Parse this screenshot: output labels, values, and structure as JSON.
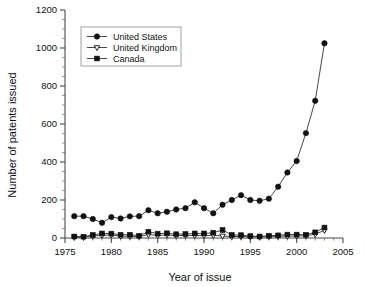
{
  "chart_data": {
    "type": "line",
    "title": "",
    "xlabel": "Year of issue",
    "ylabel": "Number of patents issued",
    "xlim": [
      1975,
      2005
    ],
    "ylim": [
      0,
      1200
    ],
    "xticks": [
      1975,
      1980,
      1985,
      1990,
      1995,
      2000,
      2005
    ],
    "xtick_labels": [
      "1975",
      "1980",
      "1985",
      "1990",
      "1995",
      "2000",
      "2005"
    ],
    "yticks": [
      0,
      200,
      400,
      600,
      800,
      1000,
      1200
    ],
    "ytick_labels": [
      "0",
      "200",
      "400",
      "600",
      "800",
      "1000",
      "1200"
    ],
    "x_minor_step": 1,
    "y_minor_step": 50,
    "grid": false,
    "legend_position": "upper left",
    "x": [
      1976,
      1977,
      1978,
      1979,
      1980,
      1981,
      1982,
      1983,
      1984,
      1985,
      1986,
      1987,
      1988,
      1989,
      1990,
      1991,
      1992,
      1993,
      1994,
      1995,
      1996,
      1997,
      1998,
      1999,
      2000,
      2001,
      2002,
      2003
    ],
    "series": [
      {
        "name": "United States",
        "marker": "filled-circle",
        "values": [
          115,
          115,
          100,
          80,
          110,
          103,
          114,
          115,
          146,
          130,
          138,
          150,
          157,
          188,
          157,
          130,
          175,
          200,
          225,
          200,
          196,
          207,
          270,
          345,
          405,
          552,
          722,
          1025
        ]
      },
      {
        "name": "United Kingdom",
        "marker": "open-triangle-down",
        "values": [
          4,
          4,
          10,
          14,
          16,
          10,
          9,
          8,
          18,
          13,
          16,
          12,
          14,
          13,
          13,
          14,
          11,
          8,
          8,
          6,
          5,
          8,
          9,
          10,
          11,
          12,
          20,
          40
        ]
      },
      {
        "name": "Canada",
        "marker": "filled-square",
        "values": [
          8,
          7,
          16,
          24,
          23,
          17,
          17,
          12,
          33,
          23,
          25,
          20,
          21,
          24,
          24,
          28,
          42,
          16,
          15,
          10,
          8,
          12,
          14,
          18,
          18,
          17,
          30,
          55
        ]
      }
    ]
  },
  "legend": {
    "entries": [
      {
        "label": "United States"
      },
      {
        "label": "United Kingdom"
      },
      {
        "label": "Canada"
      }
    ]
  },
  "colors": {
    "marker_fill": "#111111",
    "marker_open_fill": "#ffffff",
    "line": "#333333",
    "axis": "#4a4a4a",
    "background": "#ffffff"
  }
}
